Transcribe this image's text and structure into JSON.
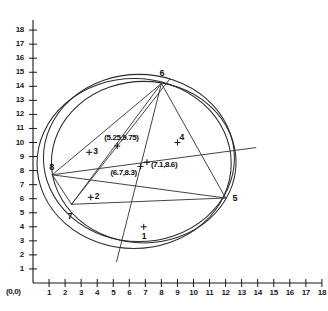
{
  "chart_data": {
    "type": "scatter",
    "title": "",
    "xlabel": "",
    "ylabel": "",
    "xlim": [
      0,
      18
    ],
    "ylim": [
      0,
      18
    ],
    "grid": false,
    "legend": null,
    "origin_label": "(0,0)",
    "x_ticks": [
      "1",
      "2",
      "3",
      "4",
      "5",
      "6",
      "7",
      "8",
      "9",
      "10",
      "11",
      "12",
      "13",
      "14",
      "15",
      "16",
      "17",
      "18"
    ],
    "y_ticks": [
      "1",
      "2",
      "3",
      "4",
      "5",
      "6",
      "7",
      "8",
      "9",
      "10",
      "11",
      "12",
      "13",
      "14",
      "15",
      "16",
      "17",
      "18"
    ],
    "vertices": [
      {
        "id": "5",
        "label": "5",
        "x": 12.0,
        "y": 6.05
      },
      {
        "id": "6",
        "label": "6",
        "x": 8.0,
        "y": 14.2
      },
      {
        "id": "7",
        "label": "7",
        "x": 2.4,
        "y": 5.6
      },
      {
        "id": "8",
        "label": "8",
        "x": 1.2,
        "y": 7.7
      }
    ],
    "marked_points": [
      {
        "id": "1",
        "label": "1",
        "x": 6.9,
        "y": 4.0
      },
      {
        "id": "2",
        "label": "2",
        "x": 3.6,
        "y": 6.1
      },
      {
        "id": "3",
        "label": "3",
        "x": 3.5,
        "y": 9.3
      },
      {
        "id": "4",
        "label": "4",
        "x": 9.0,
        "y": 10.0
      }
    ],
    "annotated_points": [
      {
        "label": "(5.25,9.75)",
        "x": 5.25,
        "y": 9.75
      },
      {
        "label": "(7.1,8.6)",
        "x": 7.1,
        "y": 8.6
      },
      {
        "label": "(6.7,8.3)",
        "x": 6.7,
        "y": 8.3
      }
    ],
    "circles": [
      {
        "cx": 6.6,
        "cy": 8.9,
        "r": 5.95
      },
      {
        "cx": 6.3,
        "cy": 8.5,
        "r": 6.05
      },
      {
        "cx": 6.9,
        "cy": 8.6,
        "r": 5.75
      }
    ],
    "chords": [
      {
        "from": "6",
        "to": "5"
      },
      {
        "from": "6",
        "to": "7"
      },
      {
        "from": "6",
        "to": "8"
      },
      {
        "from": "5",
        "to": "7"
      },
      {
        "from": "5",
        "to": "8"
      },
      {
        "from": "7",
        "to": "8"
      }
    ],
    "colors": {
      "axis": "#1a1a1a",
      "curve": "#2b2b2b",
      "chord": "#3a3a3a",
      "text": "#111111",
      "background": "#ffffff"
    }
  }
}
